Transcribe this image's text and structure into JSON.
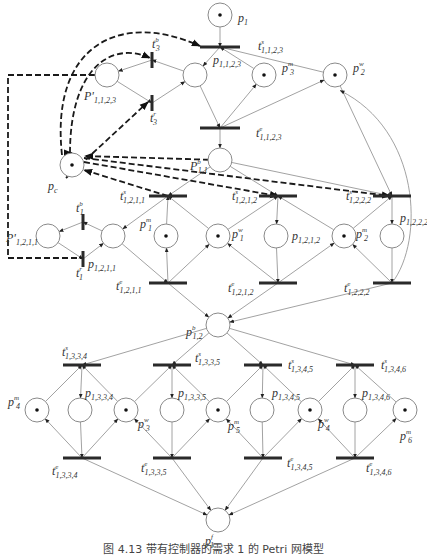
{
  "figure": {
    "caption": "图 4.13   带有控制器的需求 1 的 Petri 网模型"
  },
  "places": {
    "p1": {
      "base": "p",
      "sub": "1",
      "sup": "",
      "tokens": 1
    },
    "p_1123": {
      "base": "p",
      "sub": "1,1,2,3",
      "sup": "",
      "tokens": 0
    },
    "pp_1123": {
      "base": "P'",
      "sub": "1,1,2,3",
      "sup": "",
      "tokens": 0
    },
    "pm3_top": {
      "base": "p",
      "sub": "3",
      "sup": "m",
      "tokens": 1
    },
    "pw2": {
      "base": "p",
      "sub": "2",
      "sup": "w",
      "tokens": 1
    },
    "pc": {
      "base": "p",
      "sub": "c",
      "sup": "",
      "tokens": 1
    },
    "pb11": {
      "base": "P",
      "sub": "1,1",
      "sup": "b",
      "tokens": 0
    },
    "pp_1211": {
      "base": "P'",
      "sub": "1,2,1,1",
      "sup": "",
      "tokens": 0
    },
    "p_1211": {
      "base": "p",
      "sub": "1,2,1,1",
      "sup": "",
      "tokens": 0
    },
    "pm1": {
      "base": "p",
      "sub": "1",
      "sup": "m",
      "tokens": 1
    },
    "pw1": {
      "base": "p",
      "sub": "1",
      "sup": "w",
      "tokens": 1
    },
    "p_1212": {
      "base": "p",
      "sub": "1,2,1,2",
      "sup": "",
      "tokens": 0
    },
    "pm2": {
      "base": "p",
      "sub": "2",
      "sup": "m",
      "tokens": 1
    },
    "p_1222": {
      "base": "p",
      "sub": "1,2,2,2",
      "sup": "",
      "tokens": 0
    },
    "pb12": {
      "base": "p",
      "sub": "1,2",
      "sup": "b",
      "tokens": 0
    },
    "pm4": {
      "base": "p",
      "sub": "4",
      "sup": "m",
      "tokens": 1
    },
    "p_1334": {
      "base": "p",
      "sub": "1,3,3,4",
      "sup": "",
      "tokens": 0
    },
    "pw3": {
      "base": "p",
      "sub": "3",
      "sup": "w",
      "tokens": 1
    },
    "p_1335": {
      "base": "p",
      "sub": "1,3,3,5",
      "sup": "",
      "tokens": 0
    },
    "pm5": {
      "base": "p",
      "sub": "5",
      "sup": "m",
      "tokens": 1
    },
    "p_1345": {
      "base": "p",
      "sub": "1,3,4,5",
      "sup": "",
      "tokens": 0
    },
    "pw4": {
      "base": "p",
      "sub": "4",
      "sup": "w",
      "tokens": 1
    },
    "p_1346": {
      "base": "p",
      "sub": "1,3,4,6",
      "sup": "",
      "tokens": 0
    },
    "pm6": {
      "base": "p",
      "sub": "6",
      "sup": "m",
      "tokens": 1
    },
    "pf1": {
      "base": "p",
      "sub": "1",
      "sup": "f",
      "tokens": 0
    }
  },
  "transitions": {
    "ts_1123": {
      "base": "t",
      "sub": "1,1,2,3",
      "sup": "s"
    },
    "te_1123": {
      "base": "t",
      "sub": "1,1,2,3",
      "sup": "e"
    },
    "tb3": {
      "base": "t",
      "sub": "3",
      "sup": "b"
    },
    "tr3": {
      "base": "t",
      "sub": "3",
      "sup": "r"
    },
    "ts_1211": {
      "base": "t",
      "sub": "1,2,1,1",
      "sup": "s"
    },
    "ts_1212": {
      "base": "t",
      "sub": "1,2,1,2",
      "sup": "s"
    },
    "ts_1222": {
      "base": "t",
      "sub": "1,2,2,2",
      "sup": "s"
    },
    "tb1": {
      "base": "t",
      "sub": "1",
      "sup": "b"
    },
    "tr1": {
      "base": "t",
      "sub": "1",
      "sup": "r"
    },
    "te_1211": {
      "base": "t",
      "sub": "1,2,1,1",
      "sup": "e"
    },
    "te_1212": {
      "base": "t",
      "sub": "1,2,1,2",
      "sup": "e"
    },
    "te_1222": {
      "base": "t",
      "sub": "1,2,2,2",
      "sup": "e"
    },
    "ts_1334": {
      "base": "t",
      "sub": "1,3,3,4",
      "sup": "s"
    },
    "ts_1335": {
      "base": "t",
      "sub": "1,3,3,5",
      "sup": "s"
    },
    "ts_1345": {
      "base": "t",
      "sub": "1,3,4,5",
      "sup": "s"
    },
    "ts_1346": {
      "base": "t",
      "sub": "1,3,4,6",
      "sup": "s"
    },
    "te_1334": {
      "base": "t",
      "sub": "1,3,3,4",
      "sup": "e"
    },
    "te_1335": {
      "base": "t",
      "sub": "1,3,3,5",
      "sup": "e"
    },
    "te_1345": {
      "base": "t",
      "sub": "1,3,4,5",
      "sup": "e"
    },
    "te_1346": {
      "base": "t",
      "sub": "1,3,4,6",
      "sup": "e"
    }
  },
  "arcs": [
    [
      "p1",
      "ts_1123"
    ],
    [
      "ts_1123",
      "p_1123"
    ],
    [
      "pm3_top",
      "ts_1123"
    ],
    [
      "pw2",
      "ts_1123"
    ],
    [
      "p_1123",
      "te_1123"
    ],
    [
      "te_1123",
      "pm3_top"
    ],
    [
      "te_1123",
      "pw2"
    ],
    [
      "te_1123",
      "pb11"
    ],
    [
      "p_1123",
      "tb3"
    ],
    [
      "tb3",
      "pp_1123"
    ],
    [
      "pp_1123",
      "tr3"
    ],
    [
      "tr3",
      "p_1123"
    ],
    [
      "pb11",
      "ts_1211"
    ],
    [
      "pb11",
      "ts_1212"
    ],
    [
      "pb11",
      "ts_1222"
    ],
    [
      "ts_1211",
      "p_1211"
    ],
    [
      "pm1",
      "ts_1211"
    ],
    [
      "pw1",
      "ts_1211"
    ],
    [
      "ts_1212",
      "p_1212"
    ],
    [
      "pw1",
      "ts_1212"
    ],
    [
      "pm2",
      "ts_1212"
    ],
    [
      "ts_1222",
      "p_1222"
    ],
    [
      "pm2",
      "ts_1222"
    ],
    [
      "pw2",
      "ts_1222"
    ],
    [
      "p_1211",
      "tb1"
    ],
    [
      "tb1",
      "pp_1211"
    ],
    [
      "pp_1211",
      "tr1"
    ],
    [
      "tr1",
      "p_1211"
    ],
    [
      "p_1211",
      "te_1211"
    ],
    [
      "te_1211",
      "pm1"
    ],
    [
      "te_1211",
      "pw1"
    ],
    [
      "p_1212",
      "te_1212"
    ],
    [
      "te_1212",
      "pw1"
    ],
    [
      "te_1212",
      "pm2"
    ],
    [
      "p_1222",
      "te_1222"
    ],
    [
      "te_1222",
      "pm2"
    ],
    [
      "te_1222",
      "pw2"
    ],
    [
      "te_1211",
      "pb12"
    ],
    [
      "te_1212",
      "pb12"
    ],
    [
      "te_1222",
      "pb12"
    ],
    [
      "pb12",
      "ts_1334"
    ],
    [
      "pb12",
      "ts_1335"
    ],
    [
      "pb12",
      "ts_1345"
    ],
    [
      "pb12",
      "ts_1346"
    ],
    [
      "ts_1334",
      "p_1334"
    ],
    [
      "pm4",
      "ts_1334"
    ],
    [
      "pw3",
      "ts_1334"
    ],
    [
      "ts_1335",
      "p_1335"
    ],
    [
      "pw3",
      "ts_1335"
    ],
    [
      "pm5",
      "ts_1335"
    ],
    [
      "ts_1345",
      "p_1345"
    ],
    [
      "pm5",
      "ts_1345"
    ],
    [
      "pw4",
      "ts_1345"
    ],
    [
      "ts_1346",
      "p_1346"
    ],
    [
      "pw4",
      "ts_1346"
    ],
    [
      "pm6",
      "ts_1346"
    ],
    [
      "p_1334",
      "te_1334"
    ],
    [
      "te_1334",
      "pm4"
    ],
    [
      "te_1334",
      "pw3"
    ],
    [
      "p_1335",
      "te_1335"
    ],
    [
      "te_1335",
      "pw3"
    ],
    [
      "te_1335",
      "pm5"
    ],
    [
      "p_1345",
      "te_1345"
    ],
    [
      "te_1345",
      "pm5"
    ],
    [
      "te_1345",
      "pw4"
    ],
    [
      "p_1346",
      "te_1346"
    ],
    [
      "te_1346",
      "pw4"
    ],
    [
      "te_1346",
      "pm6"
    ],
    [
      "te_1334",
      "pf1"
    ],
    [
      "te_1335",
      "pf1"
    ],
    [
      "te_1345",
      "pf1"
    ],
    [
      "te_1346",
      "pf1"
    ]
  ],
  "control_arcs": [
    [
      "pc",
      "ts_1123"
    ],
    [
      "pc",
      "tb3"
    ],
    [
      "pp_1123",
      "pc"
    ],
    [
      "ts_1211",
      "pc"
    ],
    [
      "pc",
      "ts_1212"
    ],
    [
      "pc",
      "ts_1222"
    ],
    [
      "pb11",
      "pc"
    ],
    [
      "pp_1211",
      "pc"
    ]
  ]
}
